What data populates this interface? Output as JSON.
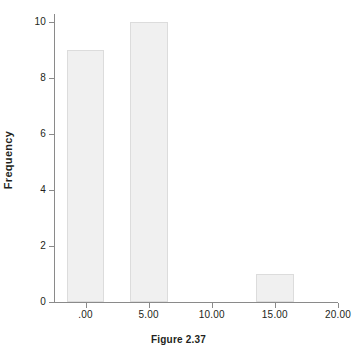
{
  "chart_data": {
    "type": "bar",
    "title": "",
    "subtitle": "",
    "xlabel": "",
    "ylabel": "Frequency",
    "caption": "Figure 2.37",
    "grid": false,
    "legend": false,
    "legend_position": "none",
    "xlim": [
      -2.5,
      20.0
    ],
    "ylim": [
      0,
      10
    ],
    "x_tick_labels": [
      ".00",
      "5.00",
      "10.00",
      "15.00",
      "20.00"
    ],
    "x_tick_values": [
      0,
      5,
      10,
      15,
      20
    ],
    "y_tick_labels": [
      "0",
      "2",
      "4",
      "6",
      "8",
      "10"
    ],
    "y_tick_values": [
      0,
      2,
      4,
      6,
      8,
      10
    ],
    "categories": [
      ".00",
      "5.00",
      "15.00"
    ],
    "values": [
      9,
      10,
      1
    ],
    "bars": [
      {
        "label": ".00",
        "value": 9,
        "bin_center": 0,
        "bin_left": -1.5,
        "bin_right": 1.5
      },
      {
        "label": "5.00",
        "value": 10,
        "bin_center": 5,
        "bin_left": 3.5,
        "bin_right": 6.5
      },
      {
        "label": "15.00",
        "value": 1,
        "bin_center": 15,
        "bin_left": 13.5,
        "bin_right": 16.5
      }
    ],
    "colors": {
      "bar_fill": "#f0f0f0",
      "bar_border": "#dcdcdc",
      "axis": "#8a8a8a",
      "text": "#231f20",
      "background": "#ffffff"
    }
  }
}
